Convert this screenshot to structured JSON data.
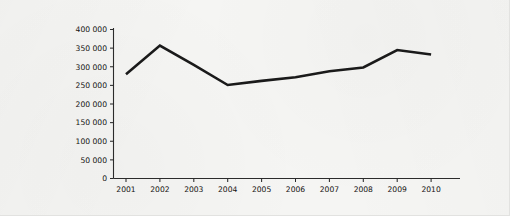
{
  "chart_data": {
    "type": "line",
    "title": "",
    "subtitle": "",
    "xlabel": "",
    "ylabel": "",
    "categories": [
      "2001",
      "2002",
      "2003",
      "2004",
      "2005",
      "2006",
      "2007",
      "2008",
      "2009",
      "2010"
    ],
    "x": [
      2001,
      2002,
      2003,
      2004,
      2005,
      2006,
      2007,
      2008,
      2009,
      2010
    ],
    "series": [
      {
        "name": "",
        "color": "#1a1a1a",
        "values": [
          280000,
          357000,
          305000,
          251000,
          262000,
          272000,
          288000,
          298000,
          345000,
          333000
        ]
      }
    ],
    "ylim": [
      0,
      400000
    ],
    "yticks": [
      0,
      50000,
      100000,
      150000,
      200000,
      250000,
      300000,
      350000,
      400000
    ],
    "ytick_labels": [
      "0",
      "50 000",
      "100 000",
      "150 000",
      "200 000",
      "250 000",
      "300 000",
      "350 000",
      "400 000"
    ],
    "xtick_labels": [
      "2001",
      "2002",
      "2003",
      "2004",
      "2005",
      "2006",
      "2007",
      "2008",
      "2009",
      "2010"
    ],
    "grid": false,
    "legend": false,
    "legend_position": "none",
    "background_color": "#f5f5f3",
    "axis_color": "#2b2b2b"
  }
}
